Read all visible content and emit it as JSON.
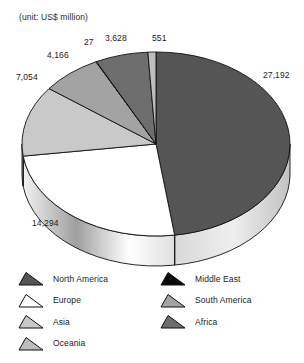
{
  "unit_note": "(unit: US$ million)",
  "chart_data": {
    "type": "pie",
    "title": "",
    "unit": "US$ million",
    "labels": [
      "North America",
      "Europe",
      "Asia",
      "South America",
      "Middle East",
      "Africa",
      "Oceania"
    ],
    "values": [
      27192,
      14294,
      7054,
      4166,
      27,
      3628,
      551
    ],
    "value_labels": [
      "27,192",
      "14,294",
      "7,054",
      "4,166",
      "27",
      "3,628",
      "551"
    ],
    "colors": [
      "#555555",
      "#ffffff",
      "#c9c9c9",
      "#a3a3a3",
      "#0a0a0a",
      "#6e6e6e",
      "#bdbdbd"
    ],
    "total": 56912,
    "legend_position": "bottom",
    "grid": false,
    "three_d": true,
    "start_angle_deg": 0,
    "direction": "clockwise"
  },
  "data_labels": [
    {
      "text": "27,192",
      "x": 263,
      "y": 70
    },
    {
      "text": "14,294",
      "x": 32,
      "y": 218
    },
    {
      "text": "7,054",
      "x": 16,
      "y": 72
    },
    {
      "text": "4,166",
      "x": 47,
      "y": 50
    },
    {
      "text": "27",
      "x": 84,
      "y": 37
    },
    {
      "text": "3,628",
      "x": 105,
      "y": 33
    },
    {
      "text": "551",
      "x": 152,
      "y": 33
    }
  ],
  "legend": {
    "left_column": [
      {
        "label": "North America",
        "color": "#555555"
      },
      {
        "label": "Europe",
        "color": "#ffffff"
      },
      {
        "label": "Asia",
        "color": "#c9c9c9"
      },
      {
        "label": "Oceania",
        "color": "#bdbdbd"
      }
    ],
    "right_column": [
      {
        "label": "Middle East",
        "color": "#0a0a0a"
      },
      {
        "label": "South America",
        "color": "#a3a3a3"
      },
      {
        "label": "Africa",
        "color": "#6e6e6e"
      }
    ]
  }
}
